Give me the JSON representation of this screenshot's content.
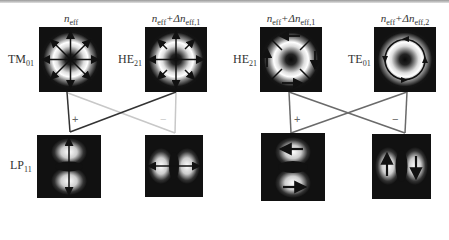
{
  "figure": {
    "top_labels": [
      {
        "main": "n",
        "sub": "eff",
        "suffix": ""
      },
      {
        "main": "n",
        "sub": "eff",
        "suffix": "+Δn",
        "suffix_sub": "eff,1"
      },
      {
        "main": "n",
        "sub": "eff",
        "suffix": "+Δn",
        "suffix_sub": "eff,1"
      },
      {
        "main": "n",
        "sub": "eff",
        "suffix": "+Δn",
        "suffix_sub": "eff,2"
      }
    ],
    "side_labels": [
      {
        "main": "TM",
        "sub": "01"
      },
      {
        "main": "HE",
        "sub": "21"
      },
      {
        "main": "HE",
        "sub": "21"
      },
      {
        "main": "TE",
        "sub": "01"
      },
      {
        "main": "LP",
        "sub": "11"
      }
    ],
    "signs": {
      "plus": "+",
      "minus": "−"
    },
    "modes": [
      {
        "id": "TM01",
        "pattern": "ring",
        "arrows": "radial-outward"
      },
      {
        "id": "HE21",
        "pattern": "ring",
        "arrows": "hyperbolic"
      },
      {
        "id": "HE21-rot",
        "pattern": "ring",
        "arrows": "rotated-hyperbolic"
      },
      {
        "id": "TE01",
        "pattern": "ring",
        "arrows": "azimuthal"
      },
      {
        "id": "LP11-a",
        "pattern": "two-lobe-vertical",
        "arrows": "vertical-outward"
      },
      {
        "id": "LP11-b",
        "pattern": "two-lobe-horizontal",
        "arrows": "horizontal-outward"
      },
      {
        "id": "LP11-c",
        "pattern": "two-lobe-vertical",
        "arrows": "horizontal-opposed"
      },
      {
        "id": "LP11-d",
        "pattern": "two-lobe-horizontal",
        "arrows": "vertical-opposed"
      }
    ],
    "colors": {
      "dark_line": "#333333",
      "light_line": "#c8c8c8",
      "mid_line": "#6a6a6a",
      "box": "#111111"
    }
  }
}
